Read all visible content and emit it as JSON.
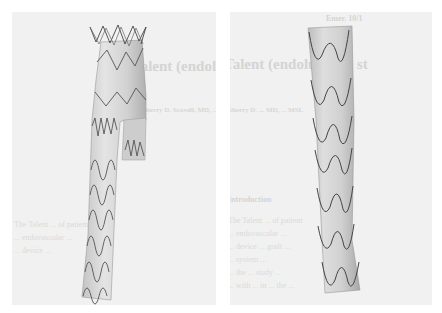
{
  "figure": {
    "panels": [
      {
        "id": "left",
        "subject": "bifurcated stent graft",
        "background": "#f1f1f1",
        "bleed_through": {
          "title": "Talent (endoluminal st",
          "author": "Sherry D. Scovell, MD, ... MSL",
          "body_lines": [
            "The Talent ... of patient",
            "... endovascular ...",
            "... device ...",
            "...",
            "...",
            "..."
          ]
        }
      },
      {
        "id": "right",
        "subject": "straight tubular stent graft",
        "background": "#f1f1f1",
        "bleed_through": {
          "header": "Emer. 10/1",
          "title": "Talent (endoluminal st",
          "author": "Sherry D. ... MD, ... MSL",
          "section": "Introduction",
          "body_lines": [
            "The Talent ... of patient",
            "... endovascular ...",
            "... device ... graft ...",
            "... system ...",
            "... the ... study ...",
            "... with ... in ... the ..."
          ]
        }
      }
    ],
    "colors": {
      "page": "#ffffff",
      "panel_bg": "#f1f1f1",
      "graft_fabric": "#d9d9d9",
      "graft_shadow": "#b8b8b8",
      "stent_wire": "#555555"
    }
  }
}
